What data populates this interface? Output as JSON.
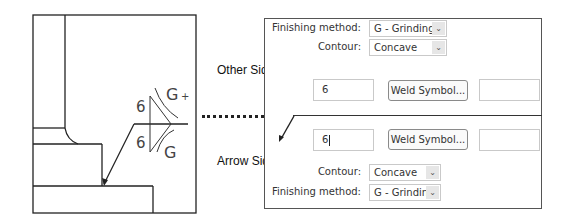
{
  "drawing": {
    "other_side_size": "6",
    "other_side_finish": "G",
    "other_side_extra": "+",
    "arrow_side_size": "6",
    "arrow_side_finish": "G"
  },
  "side_labels": {
    "other_side": "Other Side",
    "arrow_side": "Arrow Side"
  },
  "other_side": {
    "finishing_method_label": "Finishing method:",
    "finishing_method_value": "G - Grinding",
    "contour_label": "Contour:",
    "contour_value": "Concave",
    "size_value": "6",
    "weld_symbol_button": "Weld Symbol...",
    "length_value": ""
  },
  "arrow_side": {
    "size_value": "6",
    "weld_symbol_button": "Weld Symbol...",
    "length_value": "",
    "contour_label": "Contour:",
    "contour_value": "Concave",
    "finishing_method_label": "Finishing method:",
    "finishing_method_value": "G - Grinding"
  },
  "icons": {
    "dropdown": "⌄"
  }
}
